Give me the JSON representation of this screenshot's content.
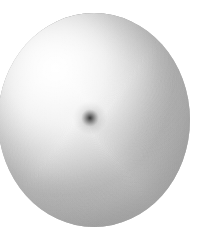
{
  "image": {
    "title": "Spiral Sphere",
    "alt_text": "Greyscale sphere covered in a dense spiral line pattern converging to a dark focal point",
    "width": 212,
    "height": 237,
    "background_color": "#ffffff"
  },
  "sphere": {
    "name": "spiral-sphere",
    "center_x": 94,
    "center_y": 120,
    "radius_x": 96,
    "radius_y": 107,
    "edge_color": "#a3a3a3",
    "highlight_color": "#ffffff",
    "midtone_color": "#d8d8d8",
    "shadow_color": "#a8a8a8",
    "highlight_x": 34,
    "highlight_y": 52
  },
  "spiral": {
    "name": "spiral-vortex",
    "focus_x": 90,
    "focus_y": 118,
    "arm_count": 96,
    "turns": 3.1,
    "direction": "counterclockwise",
    "line_color": "#6e6e6e",
    "line_width": 0.55,
    "max_radius": 128,
    "core_color": "#3a3a3a",
    "core_radius": 9
  },
  "chart_data": {
    "type": "scatter",
    "xlabel": "",
    "ylabel": "",
    "series": [
      {
        "name": "spiral-arms",
        "count": 96,
        "turns": 3.1,
        "max_radius": 128
      }
    ]
  }
}
